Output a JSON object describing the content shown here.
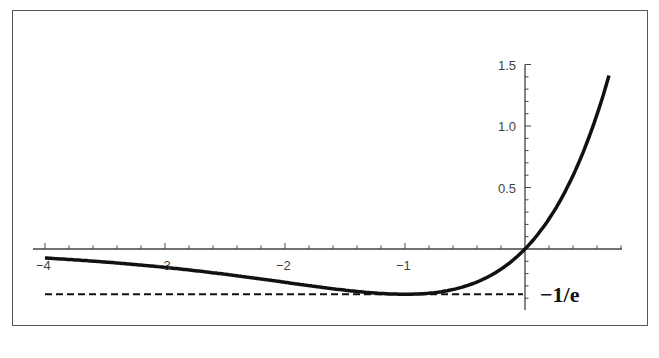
{
  "chart_data": {
    "type": "line",
    "title": "",
    "xlabel": "",
    "ylabel": "",
    "function": "y = x * e^x",
    "xlim": [
      -4.1,
      0.8
    ],
    "ylim": [
      -0.5,
      1.5
    ],
    "x_ticks": [
      -4,
      -3,
      -2,
      -1
    ],
    "x_tick_labels": [
      "-4",
      "-3",
      "-2",
      "-1"
    ],
    "y_ticks": [
      0.5,
      1.0,
      1.5
    ],
    "y_tick_labels": [
      "0.5",
      "1.0",
      "1.5"
    ],
    "grid": false,
    "legend": null,
    "series": [
      {
        "name": "x e^x",
        "style": "solid",
        "color": "#111111",
        "x": [
          -4,
          -3.5,
          -3,
          -2.5,
          -2,
          -1.5,
          -1.25,
          -1,
          -0.75,
          -0.5,
          -0.25,
          0,
          0.25,
          0.5,
          0.7
        ],
        "y": [
          -0.0733,
          -0.1057,
          -0.1494,
          -0.2052,
          -0.2707,
          -0.3347,
          -0.3581,
          -0.3679,
          -0.3543,
          -0.3033,
          -0.1947,
          0,
          0.321,
          0.8244,
          1.4096
        ]
      },
      {
        "name": "y = -1/e",
        "style": "dashed",
        "color": "#111111",
        "x": [
          -4,
          0
        ],
        "y": [
          -0.3679,
          -0.3679
        ]
      }
    ],
    "annotations": [
      {
        "text": "−1/e",
        "x": 0.05,
        "y": -0.3679
      }
    ]
  },
  "labels": {
    "annotation": "−1/e",
    "x_ticks": [
      "−4",
      "−3",
      "−2",
      "−1"
    ],
    "y_ticks": [
      "0.5",
      "1.0",
      "1.5"
    ]
  }
}
